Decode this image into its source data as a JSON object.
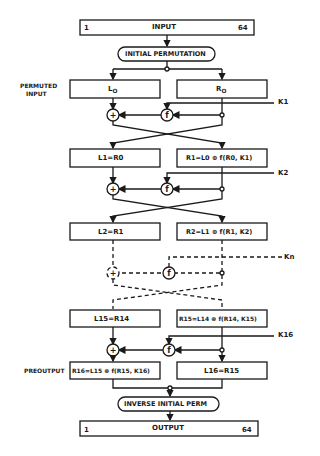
{
  "diagram": {
    "input": {
      "label": "INPUT",
      "start": "1",
      "end": "64"
    },
    "initial_permutation": "INITIAL PERMUTATION",
    "permuted_input_label": [
      "PERMUTED",
      "INPUT"
    ],
    "rounds": [
      {
        "left": "L",
        "left_sub": "O",
        "right": "R",
        "right_sub": "O"
      },
      {
        "left": "L1=R0",
        "right": "R1=L0 ⊕ f(R0, K1)"
      },
      {
        "left": "L2=R1",
        "right": "R2=L1 ⊕ f(R1, K2)"
      },
      {
        "left": "L15=R14",
        "right": "R15=L14 ⊕ f(R14, K15)"
      }
    ],
    "keys": [
      "K1",
      "K2",
      "Kn",
      "K16"
    ],
    "function_symbol": "f",
    "xor_symbol": "+",
    "preoutput_label": "PREOUTPUT",
    "preoutput": {
      "left": "R16=L15 ⊕ f(R15, K16)",
      "right": "L16=R15"
    },
    "inverse_permutation": "INVERSE INITIAL PERM",
    "output": {
      "label": "OUTPUT",
      "start": "1",
      "end": "64"
    }
  }
}
